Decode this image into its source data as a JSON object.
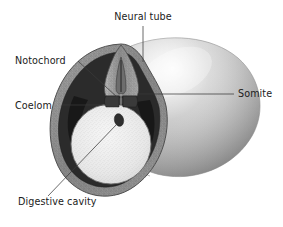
{
  "figure": {
    "name": "vertebrate-embryo-cross-section",
    "background_color": "#ffffff",
    "width": 283,
    "height": 227
  },
  "labels": [
    {
      "id": "neural-tube",
      "text": "Neural tube",
      "x": 143,
      "y": 20,
      "anchor": "middle"
    },
    {
      "id": "notochord",
      "text": "Notochord",
      "x": 15,
      "y": 64,
      "anchor": "start"
    },
    {
      "id": "coelom",
      "text": "Coelom",
      "x": 15,
      "y": 109,
      "anchor": "start"
    },
    {
      "id": "somite",
      "text": "Somite",
      "x": 238,
      "y": 97,
      "anchor": "start"
    },
    {
      "id": "digestive-cavity",
      "text": "Digestive cavity",
      "x": 18,
      "y": 205,
      "anchor": "start"
    }
  ],
  "leader_lines": [
    {
      "id": "neural-tube-leader",
      "points": "143,26 143,62"
    },
    {
      "id": "notochord-leader",
      "points": "78,61 118,88"
    },
    {
      "id": "coelom-leader",
      "points": "62,105 106,105"
    },
    {
      "id": "somite-leader",
      "points": "234,94 139,94"
    },
    {
      "id": "digestive-cavity-leader",
      "points": "48,196 124,120"
    }
  ],
  "structures": [
    {
      "id": "body-mass",
      "label": "Body mass (3D egg-shaped trunk)",
      "fill": "gray-gradient"
    },
    {
      "id": "ectoderm-ring",
      "label": "Outer ectoderm / cellular ring",
      "fill": "#8e8e8e"
    },
    {
      "id": "mesoderm-coelom",
      "label": "Dark mesoderm and coelom band",
      "fill": "#2b2b2b"
    },
    {
      "id": "yolk-mass",
      "label": "Speckled yolk / archenteron mass",
      "fill": "#ececec"
    },
    {
      "id": "digestive-cavity-dot",
      "label": "Digestive cavity",
      "fill": "#303030"
    },
    {
      "id": "neural-tube-structure",
      "label": "Neural tube",
      "fill": "#9a9a9a"
    },
    {
      "id": "notochord-structure",
      "label": "Notochord",
      "fill": "#4a4a4a"
    },
    {
      "id": "somite-structure",
      "label": "Somite",
      "fill": "#3a3a3a"
    }
  ],
  "colors": {
    "text": "#1b1b1b",
    "leader": "#3a3a3a",
    "dark_tissue": "#2b2b2b",
    "mid_gray": "#8e8e8e",
    "light_gray": "#d7d7d7",
    "yolk": "#ececec",
    "background": "#ffffff"
  }
}
